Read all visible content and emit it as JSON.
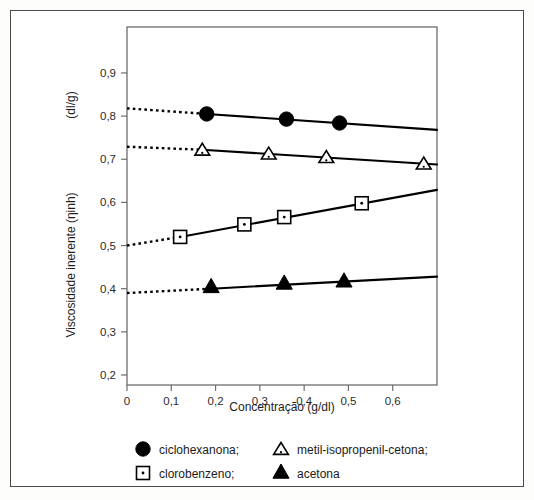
{
  "figure": {
    "background_color": "#ffffff",
    "border_color": "#4a4a4a"
  },
  "chart_data": {
    "type": "scatter",
    "title": "",
    "subtitle": "",
    "xlabel": "Concentração (g/dl)",
    "ylabel": "Viscosidade inerente (ηinh)   (dl/g)",
    "ylabel_part1": "Viscosidade inerente (ηinh)",
    "ylabel_part2": "(dl/g)",
    "xlim": [
      0,
      0.7
    ],
    "ylim": [
      0.2,
      0.95
    ],
    "grid": false,
    "legend_position": "below-axes",
    "xticks": [
      0,
      0.1,
      0.2,
      0.3,
      0.4,
      0.5,
      0.6
    ],
    "xtick_labels": [
      "0",
      "0,1",
      "0,2",
      "0,3",
      "0,4",
      "0,5",
      "0,6"
    ],
    "yticks": [
      0.2,
      0.3,
      0.4,
      0.5,
      0.6,
      0.7,
      0.8,
      0.9
    ],
    "ytick_labels": [
      "0,2",
      "0,3",
      "0,4",
      "0,5",
      "0,6",
      "0,7",
      "0,8",
      "0,9"
    ],
    "series": [
      {
        "name": "ciclohexanona;",
        "marker": "filled-circle",
        "color": "#000000",
        "x": [
          0.18,
          0.36,
          0.48
        ],
        "y": [
          0.805,
          0.793,
          0.784
        ],
        "fit_line": {
          "x": [
            0.18,
            0.7
          ],
          "y": [
            0.805,
            0.768
          ]
        },
        "extrapolation": {
          "x": [
            0.0,
            0.18
          ],
          "y": [
            0.818,
            0.805
          ]
        },
        "intercept": 0.818
      },
      {
        "name": "metil-isopropenil-cetona;",
        "marker": "open-triangle",
        "color": "#000000",
        "x": [
          0.17,
          0.32,
          0.45,
          0.67
        ],
        "y": [
          0.722,
          0.713,
          0.705,
          0.69
        ],
        "fit_line": {
          "x": [
            0.17,
            0.7
          ],
          "y": [
            0.722,
            0.688
          ]
        },
        "extrapolation": {
          "x": [
            0.0,
            0.17
          ],
          "y": [
            0.729,
            0.722
          ]
        },
        "intercept": 0.729
      },
      {
        "name": "clorobenzeno;",
        "marker": "open-square",
        "color": "#000000",
        "x": [
          0.12,
          0.265,
          0.355,
          0.53
        ],
        "y": [
          0.52,
          0.549,
          0.566,
          0.598
        ],
        "fit_line": {
          "x": [
            0.12,
            0.7
          ],
          "y": [
            0.52,
            0.629
          ]
        },
        "extrapolation": {
          "x": [
            0.0,
            0.12
          ],
          "y": [
            0.5,
            0.52
          ]
        },
        "intercept": 0.5
      },
      {
        "name": "acetona",
        "marker": "filled-triangle",
        "color": "#000000",
        "x": [
          0.19,
          0.355,
          0.49
        ],
        "y": [
          0.403,
          0.411,
          0.416
        ],
        "fit_line": {
          "x": [
            0.19,
            0.7
          ],
          "y": [
            0.4,
            0.428
          ]
        },
        "extrapolation": {
          "x": [
            0.0,
            0.19
          ],
          "y": [
            0.39,
            0.4
          ]
        },
        "intercept": 0.39
      }
    ],
    "legend": [
      {
        "label": "ciclohexanona;",
        "marker": "filled-circle"
      },
      {
        "label": "metil-isopropenil-cetona;",
        "marker": "open-triangle"
      },
      {
        "label": "clorobenzeno;",
        "marker": "open-square"
      },
      {
        "label": "acetona",
        "marker": "filled-triangle"
      }
    ]
  }
}
